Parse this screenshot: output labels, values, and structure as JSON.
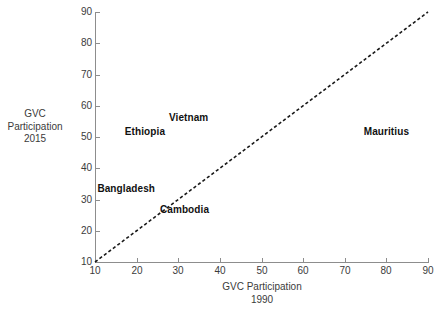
{
  "chart_data": {
    "type": "scatter",
    "title": "",
    "subtitle": "",
    "xlabel": "GVC Participation",
    "xlabel_line2": "1990",
    "ylabel": "GVC",
    "ylabel_line2": "Participation",
    "ylabel_line3": "2015",
    "xlim": [
      10,
      90
    ],
    "ylim": [
      10,
      90
    ],
    "xticks": [
      10,
      20,
      30,
      40,
      50,
      60,
      70,
      80,
      90
    ],
    "yticks": [
      10,
      20,
      30,
      40,
      50,
      60,
      70,
      80,
      90
    ],
    "xtick_labels": [
      "10",
      "20",
      "30",
      "40",
      "50",
      "60",
      "70",
      "80",
      "90"
    ],
    "ytick_labels": [
      "10",
      "20",
      "30",
      "40",
      "50",
      "60",
      "70",
      "80",
      "90"
    ],
    "grid": false,
    "legend": "none",
    "annotations": [
      {
        "label": "Ethiopia",
        "x": 22.0,
        "y": 51.5
      },
      {
        "label": "Vietnam",
        "x": 32.5,
        "y": 56.0
      },
      {
        "label": "Bangladesh",
        "x": 17.5,
        "y": 33.5
      },
      {
        "label": "Cambodia",
        "x": 31.5,
        "y": 26.5
      },
      {
        "label": "Mauritius",
        "x": 80.0,
        "y": 51.5
      }
    ],
    "reference_line": {
      "name": "45-degree-line",
      "style": "dashed",
      "color": "#1a1a1a",
      "from": [
        10,
        10
      ],
      "to": [
        90,
        90
      ]
    },
    "colors": {
      "axis": "#8d8d8d",
      "tick_text": "#3b3b3b",
      "label_text": "#111111",
      "background": "#ffffff"
    }
  }
}
